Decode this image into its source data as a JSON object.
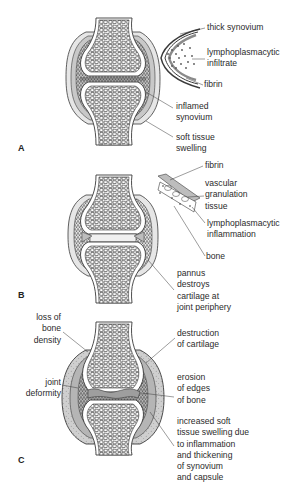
{
  "figure": {
    "panels": [
      {
        "letter": "A",
        "labels": {
          "thick_synovium": [
            "thick synovium"
          ],
          "lymphoplasmacytic_infiltrate": [
            "lymphoplasmacytic",
            "infiltrate"
          ],
          "fibrin": [
            "fibrin"
          ],
          "inflamed_synovium": [
            "inflamed",
            "synovium"
          ],
          "soft_tissue_swelling": [
            "soft tissue",
            "swelling"
          ]
        }
      },
      {
        "letter": "B",
        "labels": {
          "fibrin": [
            "fibrin"
          ],
          "vascular_granulation_tissue": [
            "vascular",
            "granulation",
            "tissue"
          ],
          "lymphoplasmacytic_inflammation": [
            "lymphoplasmacytic",
            "inflammation"
          ],
          "bone": [
            "bone"
          ],
          "pannus": [
            "pannus",
            "destroys",
            "cartilage at",
            "joint periphery"
          ]
        }
      },
      {
        "letter": "C",
        "labels": {
          "loss_of_bone_density": [
            "loss of",
            "bone",
            "density"
          ],
          "joint_deformity": [
            "joint",
            "deformity"
          ],
          "destruction_of_cartilage": [
            "destruction",
            "of cartilage"
          ],
          "erosion_of_edges": [
            "erosion",
            "of edges",
            "of bone"
          ],
          "increased_swelling": [
            "increased soft",
            "tissue swelling due",
            "to inflammation",
            "and thickening",
            "of synovium",
            "and capsule"
          ]
        }
      }
    ],
    "colors": {
      "line": "#3a3a3a",
      "synovium_fill": "#bdbdbd",
      "capsule_fill": "#d9d9d9",
      "background": "#ffffff"
    }
  }
}
